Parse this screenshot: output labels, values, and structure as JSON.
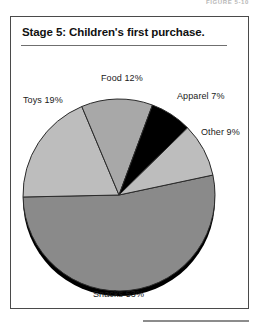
{
  "figure": {
    "caption": "Figure 5-10"
  },
  "chart_title": "Stage 5: Children's first purchase.",
  "labels": {
    "toys": "Toys 19%",
    "food": "Food 12%",
    "apparel": "Apparel 7%",
    "other": "Other 9%",
    "snacks": "Snacks 53%"
  },
  "colors": {
    "snacks": "#8a8a8a",
    "toys": "#bdbdbd",
    "food": "#a8a8a8",
    "apparel": "#000000",
    "other": "#bdbdbd",
    "outline": "#2b2b2b",
    "shadow": "#000000",
    "frame": "#4a4a4a",
    "text": "#1a1a1a"
  },
  "chart_data": {
    "type": "pie",
    "title": "Stage 5: Children's first purchase.",
    "categories": [
      "Snacks",
      "Toys",
      "Food",
      "Apparel",
      "Other"
    ],
    "values": [
      53,
      19,
      12,
      7,
      9
    ],
    "unit": "%",
    "total": 100,
    "legend": "none",
    "data_labels": [
      "Snacks 53%",
      "Toys 19%",
      "Food 12%",
      "Apparel 7%",
      "Other 9%"
    ],
    "slice_colors": [
      "#8a8a8a",
      "#bdbdbd",
      "#a8a8a8",
      "#000000",
      "#bdbdbd"
    ],
    "start_angle_deg": -12,
    "direction": "clockwise",
    "style": "3d-shadow-base"
  }
}
